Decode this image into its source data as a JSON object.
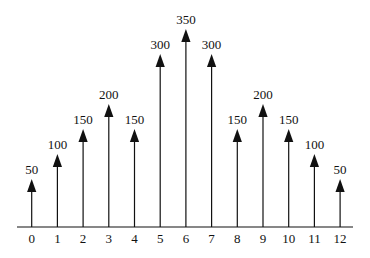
{
  "figure": {
    "background": "#ffffff",
    "ink_color": "#111111"
  },
  "chart_data": {
    "type": "stem",
    "title": "",
    "xlabel": "",
    "ylabel": "",
    "x": [
      0,
      1,
      2,
      3,
      4,
      5,
      6,
      7,
      8,
      9,
      10,
      11,
      12
    ],
    "values": [
      50,
      100,
      150,
      200,
      150,
      300,
      350,
      300,
      150,
      200,
      150,
      100,
      50
    ],
    "xlim": [
      0,
      12
    ],
    "ylim": [
      0,
      350
    ],
    "grid": false,
    "legend": false,
    "marker": "filled-up-arrowhead",
    "value_labels_shown": true
  }
}
